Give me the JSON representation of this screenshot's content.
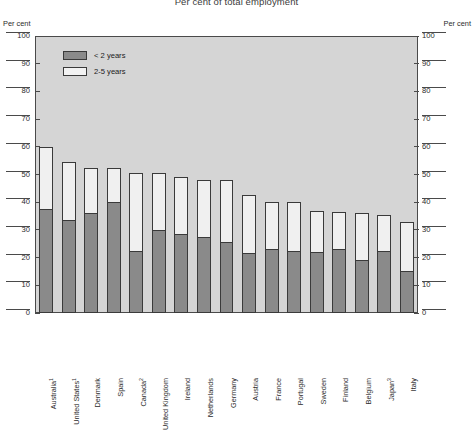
{
  "chart_data": {
    "type": "bar",
    "title": "Per cent of total employment",
    "subtitle": "",
    "xlabel": "",
    "ylabel": "Per cent",
    "ylabel_right": "Per cent",
    "ylim": [
      0,
      100
    ],
    "ytick_step": 10,
    "yticks": [
      0,
      10,
      20,
      30,
      40,
      50,
      60,
      70,
      80,
      90,
      100
    ],
    "grid": false,
    "stacked": true,
    "legend_position": "top-left",
    "categories": [
      "Australia",
      "United States",
      "Denmark",
      "Spain",
      "Canada",
      "United Kingdom",
      "Ireland",
      "Netherlands",
      "Germany",
      "Austria",
      "France",
      "Portugal",
      "Sweden",
      "Finland",
      "Belgium",
      "Japan",
      "Italy"
    ],
    "category_footnotes": [
      "1",
      "1",
      "",
      "",
      "2",
      "",
      "",
      "",
      "",
      "",
      "",
      "",
      "",
      "",
      "",
      "3",
      ""
    ],
    "series": [
      {
        "name": "< 2 years",
        "color": "#8a8a8a",
        "values": [
          37.5,
          33.5,
          36.0,
          40.0,
          22.5,
          30.0,
          28.5,
          27.5,
          25.5,
          21.5,
          23.0,
          22.5,
          22.0,
          23.0,
          19.0,
          22.5,
          15.0
        ]
      },
      {
        "name": "2-5 years",
        "color": "#f0f0f0",
        "values": [
          22.5,
          21.0,
          16.5,
          12.5,
          28.0,
          20.5,
          20.5,
          20.5,
          22.5,
          21.0,
          17.0,
          17.5,
          15.0,
          13.5,
          17.0,
          13.0,
          18.0
        ]
      }
    ],
    "totals": [
      60.0,
      54.5,
      52.5,
      52.5,
      50.5,
      50.5,
      49.0,
      48.0,
      48.0,
      42.5,
      40.0,
      40.0,
      37.0,
      36.5,
      36.0,
      35.5,
      33.0
    ]
  },
  "legend": {
    "items": [
      {
        "label": "< 2 years",
        "swatch": "filled-gray"
      },
      {
        "label": "2-5 years",
        "swatch": "outline-white"
      }
    ]
  },
  "colors": {
    "plot_background": "#d5d5d5",
    "bar_under_2": "#8a8a8a",
    "bar_2_to_5": "#f0f0f0",
    "axis": "#4a4a4a",
    "text": "#2b2b2b"
  }
}
